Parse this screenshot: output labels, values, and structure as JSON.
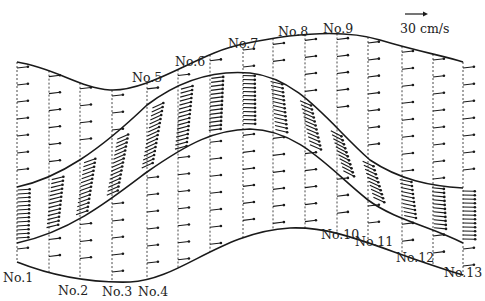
{
  "diagram": {
    "title": "",
    "scale": {
      "label": "30 cm/s",
      "arrow_length_px": 18
    },
    "sections": [
      {
        "id": "No.1",
        "label": "No.1",
        "x": 17
      },
      {
        "id": "No.2",
        "label": "No.2",
        "x": 49
      },
      {
        "id": "No.3",
        "label": "No.3",
        "x": 80
      },
      {
        "id": "No.4",
        "label": "No.4",
        "x": 112
      },
      {
        "id": "No.5",
        "label": "No.5",
        "x": 147
      },
      {
        "id": "No.6",
        "label": "No.6",
        "x": 178
      },
      {
        "id": "No.7",
        "label": "No.7",
        "x": 243
      },
      {
        "id": "No.8",
        "label": "No.8",
        "x": 273
      },
      {
        "id": "No.9",
        "label": "No.9",
        "x": 305
      },
      {
        "id": "No.10",
        "label": "No.10",
        "x": 337
      },
      {
        "id": "No.11",
        "label": "No.11",
        "x": 368
      },
      {
        "id": "No.12",
        "label": "No.12",
        "x": 402
      },
      {
        "id": "No.13",
        "label": "No.13",
        "x": 463
      }
    ],
    "extra_section_x": [
      210,
      433
    ],
    "labels": [
      {
        "text": "No.1",
        "x": 3,
        "y": 282
      },
      {
        "text": "No.2",
        "x": 58,
        "y": 295
      },
      {
        "text": "No.3",
        "x": 102,
        "y": 296
      },
      {
        "text": "No.4",
        "x": 138,
        "y": 296
      },
      {
        "text": "No.5",
        "x": 132,
        "y": 82
      },
      {
        "text": "No.6",
        "x": 175,
        "y": 66
      },
      {
        "text": "No.7",
        "x": 228,
        "y": 48
      },
      {
        "text": "No.8",
        "x": 278,
        "y": 36
      },
      {
        "text": "No.9",
        "x": 323,
        "y": 33
      },
      {
        "text": "No.10",
        "x": 321,
        "y": 239
      },
      {
        "text": "No.11",
        "x": 355,
        "y": 246
      },
      {
        "text": "No.12",
        "x": 396,
        "y": 262
      },
      {
        "text": "No.13",
        "x": 444,
        "y": 277
      }
    ],
    "curves": {
      "outer_top": "M17,62 C55,68 80,88 110,90 C150,92 200,52 243,44 C290,34 340,28 380,40 C420,52 445,56 463,62",
      "inner_upper": "M17,187 C60,178 100,150 147,105 C180,80 215,70 250,73 C300,78 330,125 370,160 C400,180 430,186 463,188",
      "inner_lower": "M17,243 C70,232 110,200 147,172 C190,142 215,130 250,129 C300,130 330,170 368,200 C395,220 430,226 463,243",
      "outer_bottom": "M17,262 C50,275 90,283 130,282 C180,280 220,232 290,228 C340,226 380,250 463,275"
    },
    "colors": {
      "ink": "#1a1a1a",
      "background": "#ffffff"
    }
  }
}
